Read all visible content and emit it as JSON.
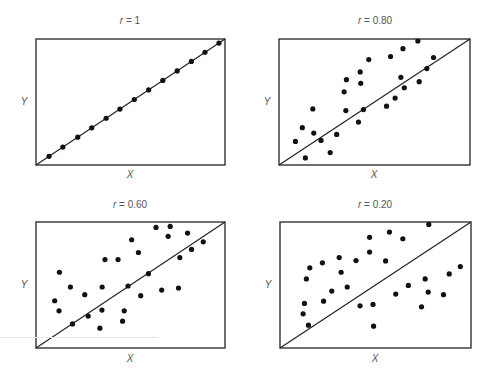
{
  "chart_data": [
    {
      "type": "scatter",
      "title": "r = 1",
      "title_prefix": "r",
      "title_value": " = 1",
      "xlabel": "X",
      "ylabel": "Y",
      "xlim": [
        0,
        1
      ],
      "ylim": [
        0,
        1
      ],
      "grid": false,
      "fit_line": [
        [
          0,
          0
        ],
        [
          1,
          1
        ]
      ],
      "points": [
        [
          0.069,
          0.069
        ],
        [
          0.142,
          0.142
        ],
        [
          0.221,
          0.221
        ],
        [
          0.295,
          0.295
        ],
        [
          0.371,
          0.371
        ],
        [
          0.444,
          0.444
        ],
        [
          0.52,
          0.52
        ],
        [
          0.596,
          0.596
        ],
        [
          0.671,
          0.671
        ],
        [
          0.747,
          0.747
        ],
        [
          0.822,
          0.822
        ],
        [
          0.894,
          0.894
        ],
        [
          0.968,
          0.968
        ]
      ]
    },
    {
      "type": "scatter",
      "title": "r = 0.80",
      "title_prefix": "r",
      "title_value": " = 0.80",
      "xlabel": "X",
      "ylabel": "Y",
      "xlim": [
        0,
        1
      ],
      "ylim": [
        0,
        1
      ],
      "grid": false,
      "fit_line": [
        [
          0,
          0
        ],
        [
          1,
          1
        ]
      ],
      "points": [
        [
          0.086,
          0.187
        ],
        [
          0.138,
          0.056
        ],
        [
          0.122,
          0.296
        ],
        [
          0.177,
          0.445
        ],
        [
          0.182,
          0.253
        ],
        [
          0.22,
          0.195
        ],
        [
          0.268,
          0.099
        ],
        [
          0.302,
          0.243
        ],
        [
          0.341,
          0.581
        ],
        [
          0.353,
          0.677
        ],
        [
          0.35,
          0.432
        ],
        [
          0.416,
          0.341
        ],
        [
          0.425,
          0.739
        ],
        [
          0.428,
          0.648
        ],
        [
          0.442,
          0.44
        ],
        [
          0.47,
          0.837
        ],
        [
          0.563,
          0.467
        ],
        [
          0.584,
          0.861
        ],
        [
          0.608,
          0.531
        ],
        [
          0.638,
          0.696
        ],
        [
          0.649,
          0.923
        ],
        [
          0.656,
          0.613
        ],
        [
          0.727,
          0.984
        ],
        [
          0.734,
          0.661
        ],
        [
          0.774,
          0.765
        ],
        [
          0.809,
          0.853
        ]
      ]
    },
    {
      "type": "scatter",
      "title": "r = 0.60",
      "title_prefix": "r",
      "title_value": " = 0.60",
      "xlabel": "X",
      "ylabel": "Y",
      "xlim": [
        0,
        1
      ],
      "ylim": [
        0,
        1
      ],
      "grid": false,
      "fit_line": [
        [
          0,
          0
        ],
        [
          1,
          1
        ]
      ],
      "points": [
        [
          0.099,
          0.375
        ],
        [
          0.122,
          0.295
        ],
        [
          0.124,
          0.601
        ],
        [
          0.182,
          0.484
        ],
        [
          0.193,
          0.191
        ],
        [
          0.258,
          0.423
        ],
        [
          0.276,
          0.253
        ],
        [
          0.338,
          0.157
        ],
        [
          0.349,
          0.301
        ],
        [
          0.35,
          0.484
        ],
        [
          0.365,
          0.702
        ],
        [
          0.434,
          0.702
        ],
        [
          0.458,
          0.213
        ],
        [
          0.467,
          0.295
        ],
        [
          0.487,
          0.492
        ],
        [
          0.506,
          0.859
        ],
        [
          0.542,
          0.758
        ],
        [
          0.554,
          0.415
        ],
        [
          0.595,
          0.59
        ],
        [
          0.635,
          0.957
        ],
        [
          0.665,
          0.46
        ],
        [
          0.699,
          0.886
        ],
        [
          0.71,
          0.965
        ],
        [
          0.754,
          0.476
        ],
        [
          0.761,
          0.718
        ],
        [
          0.802,
          0.912
        ],
        [
          0.823,
          0.782
        ],
        [
          0.885,
          0.843
        ]
      ]
    },
    {
      "type": "scatter",
      "title": "r = 0.20",
      "title_prefix": "r",
      "title_value": " = 0.20",
      "xlabel": "X",
      "ylabel": "Y",
      "xlim": [
        0,
        1
      ],
      "ylim": [
        0,
        1
      ],
      "grid": false,
      "fit_line": [
        [
          0,
          0
        ],
        [
          1,
          1
        ]
      ],
      "points": [
        [
          0.121,
          0.271
        ],
        [
          0.128,
          0.354
        ],
        [
          0.149,
          0.181
        ],
        [
          0.138,
          0.548
        ],
        [
          0.156,
          0.636
        ],
        [
          0.222,
          0.676
        ],
        [
          0.228,
          0.372
        ],
        [
          0.271,
          0.452
        ],
        [
          0.31,
          0.718
        ],
        [
          0.32,
          0.601
        ],
        [
          0.352,
          0.484
        ],
        [
          0.398,
          0.694
        ],
        [
          0.419,
          0.335
        ],
        [
          0.469,
          0.878
        ],
        [
          0.469,
          0.761
        ],
        [
          0.487,
          0.346
        ],
        [
          0.49,
          0.173
        ],
        [
          0.553,
          0.691
        ],
        [
          0.573,
          0.92
        ],
        [
          0.606,
          0.428
        ],
        [
          0.643,
          0.867
        ],
        [
          0.672,
          0.497
        ],
        [
          0.741,
          0.327
        ],
        [
          0.76,
          0.548
        ],
        [
          0.776,
          0.444
        ],
        [
          0.779,
          0.981
        ],
        [
          0.856,
          0.423
        ],
        [
          0.886,
          0.588
        ],
        [
          0.944,
          0.646
        ]
      ]
    }
  ],
  "style": {
    "dot_color": "#111111",
    "line_color": "#222222",
    "frame_color": "#333333",
    "label_color": "#555555"
  }
}
